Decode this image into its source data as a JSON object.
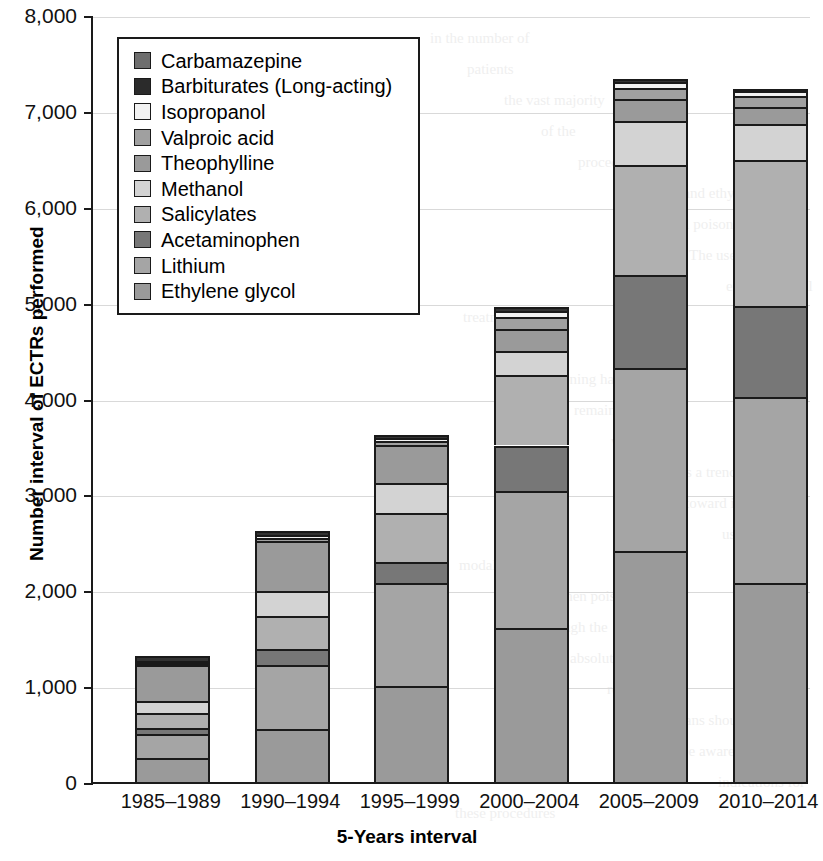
{
  "chart_data": {
    "type": "bar",
    "subtype": "stacked-bar",
    "title": "",
    "xlabel": "5-Years interval",
    "ylabel": "Number interval of ECTRs performed",
    "ylim": [
      0,
      8000
    ],
    "ytick_values": [
      0,
      1000,
      2000,
      3000,
      4000,
      5000,
      6000,
      7000,
      8000
    ],
    "ytick_labels": [
      "0",
      "1,000",
      "2,000",
      "3,000",
      "4,000",
      "5,000",
      "6,000",
      "7,000",
      "8,000"
    ],
    "categories": [
      "1985–1989",
      "1990–1994",
      "1995–1999",
      "2000–2004",
      "2005–2009",
      "2010–2014"
    ],
    "grid": true,
    "grid_axis": "y",
    "legend_position": "upper-left-inside",
    "stack_order_bottom_to_top": [
      "Ethylene glycol",
      "Lithium",
      "Acetaminophen",
      "Salicylates",
      "Methanol",
      "Theophylline",
      "Valproic acid",
      "Isopropanol",
      "Barbiturates (Long-acting)",
      "Carbamazepine"
    ],
    "series": [
      {
        "name": "Ethylene glycol",
        "color": "#9a9a9a",
        "values": [
          250,
          550,
          1000,
          1610,
          2410,
          2080
        ]
      },
      {
        "name": "Lithium",
        "color": "#a5a5a5",
        "values": [
          250,
          670,
          1080,
          1430,
          1910,
          1940
        ]
      },
      {
        "name": "Acetaminophen",
        "color": "#777777",
        "values": [
          60,
          170,
          220,
          470,
          970,
          940
        ]
      },
      {
        "name": "Salicylates",
        "color": "#b0b0b0",
        "values": [
          160,
          340,
          510,
          740,
          1150,
          1530
        ]
      },
      {
        "name": "Methanol",
        "color": "#d3d3d3",
        "values": [
          130,
          260,
          310,
          250,
          450,
          370
        ]
      },
      {
        "name": "Theophylline",
        "color": "#9a9a9a",
        "values": [
          370,
          520,
          390,
          230,
          230,
          180
        ]
      },
      {
        "name": "Valproic acid",
        "color": "#a0a0a0",
        "values": [
          25,
          40,
          45,
          120,
          120,
          120
        ]
      },
      {
        "name": "Isopropanol",
        "color": "#f2f2f2",
        "values": [
          20,
          25,
          30,
          65,
          60,
          45
        ]
      },
      {
        "name": "Barbiturates (Long-acting)",
        "color": "#333333",
        "values": [
          45,
          45,
          35,
          40,
          30,
          25
        ]
      },
      {
        "name": "Carbamazepine",
        "color": "#6e6e6e",
        "values": [
          0,
          0,
          0,
          0,
          0,
          0
        ]
      }
    ],
    "totals": [
      1310,
      2620,
      3620,
      5155,
      7330,
      7230
    ]
  },
  "legend": {
    "items": [
      {
        "label": "Carbamazepine",
        "color": "#6e6e6e"
      },
      {
        "label": "Barbiturates (Long-acting)",
        "color": "#2b2b2b"
      },
      {
        "label": "Isopropanol",
        "color": "#f2f2f2"
      },
      {
        "label": "Valproic acid",
        "color": "#a0a0a0"
      },
      {
        "label": "Theophylline",
        "color": "#9a9a9a"
      },
      {
        "label": "Methanol",
        "color": "#d3d3d3"
      },
      {
        "label": "Salicylates",
        "color": "#b0b0b0"
      },
      {
        "label": "Acetaminophen",
        "color": "#777777"
      },
      {
        "label": "Lithium",
        "color": "#a5a5a5"
      },
      {
        "label": "Ethylene glycol",
        "color": "#9a9a9a"
      }
    ]
  },
  "axes": {
    "y_title": "Number interval of ECTRs performed",
    "x_title": "5-Years interval"
  },
  "ghost_text": {
    "lines": [
      "in the number of",
      "patients",
      "the vast majority",
      "of the",
      "procedures were",
      "for lithium and ethylene",
      "glycol poisoning.",
      "The use of",
      "extracorporeal",
      "treatment in",
      "salicylate",
      "poisoning has",
      "remained stable",
      "whereas",
      "there is a trend",
      "toward increasing",
      "use of these",
      "modalities in",
      "acetaminophen poisoning",
      "although the",
      "absolute numbers",
      "remain small.",
      "Clinicians should",
      "be aware of the",
      "indications for",
      "these procedures"
    ]
  }
}
